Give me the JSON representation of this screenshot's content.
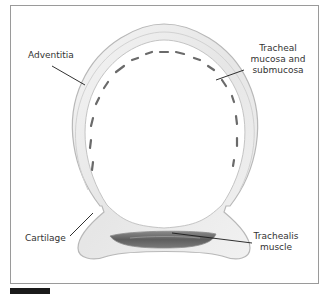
{
  "figure": {
    "type": "anatomical cross-section",
    "subject": "trachea",
    "colors": {
      "frame_border": "#9a9a9a",
      "cartilage_fill": "#ececec",
      "cartilage_edge": "#b8b8b8",
      "mucosa_marks": "#6a6a6a",
      "muscle_fill": "#6e6e6e",
      "leader_line": "#1a1a1a",
      "label_text": "#333333",
      "figure_bar": "#1a1a1a"
    }
  },
  "labels": {
    "adventitia": "Adventitia",
    "mucosa": {
      "line1": "Tracheal",
      "line2": "mucosa and",
      "line3": "submucosa"
    },
    "cartilage": "Cartilage",
    "trachealis": {
      "line1": "Trachealis",
      "line2": "muscle"
    }
  }
}
